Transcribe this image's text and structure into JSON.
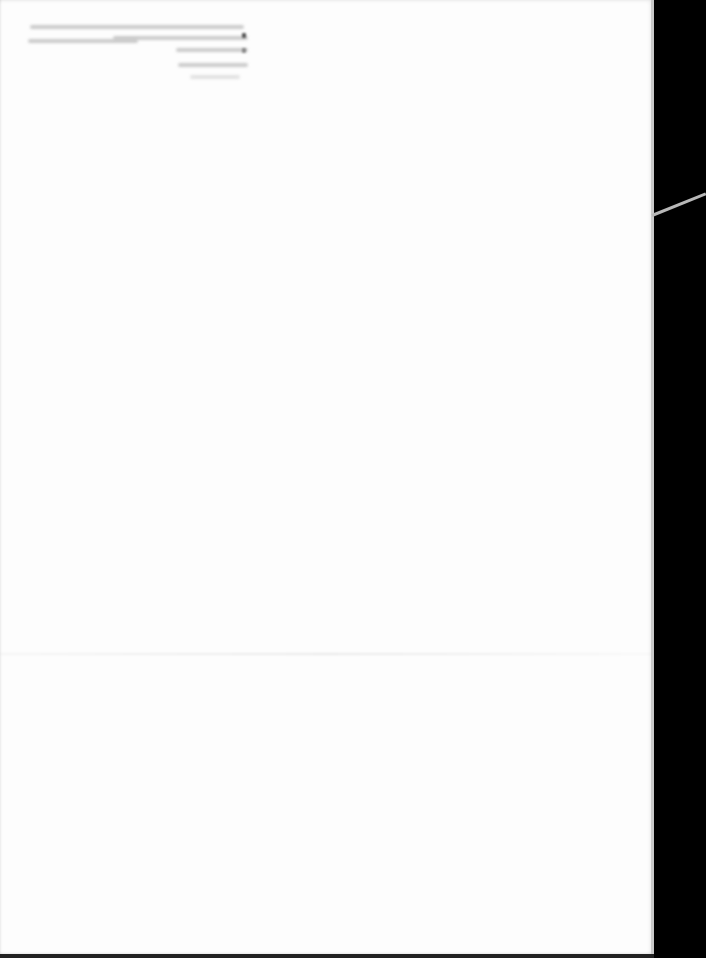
{
  "document": {
    "type": "photographed paper page",
    "header_text_legible": false,
    "header_lines": [
      {
        "left": 2,
        "top": 5,
        "width": 214
      },
      {
        "left": 0,
        "top": 19,
        "width": 110
      },
      {
        "left": 85,
        "top": 15,
        "width": 135
      },
      {
        "left": 148,
        "top": 27,
        "width": 72
      },
      {
        "left": 150,
        "top": 42,
        "width": 70
      },
      {
        "left": 162,
        "top": 54,
        "width": 50
      }
    ]
  },
  "colors": {
    "paper": "#fdfdfd",
    "background": "#000000",
    "faint_text": "#b9b9b9"
  }
}
